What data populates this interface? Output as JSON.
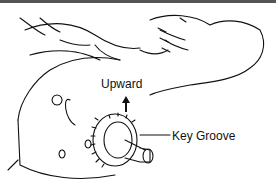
{
  "diagram": {
    "labels": {
      "upward": "Upward",
      "key_groove": "Key Groove"
    },
    "colors": {
      "ink": "#111111",
      "background": "#ffffff"
    }
  }
}
